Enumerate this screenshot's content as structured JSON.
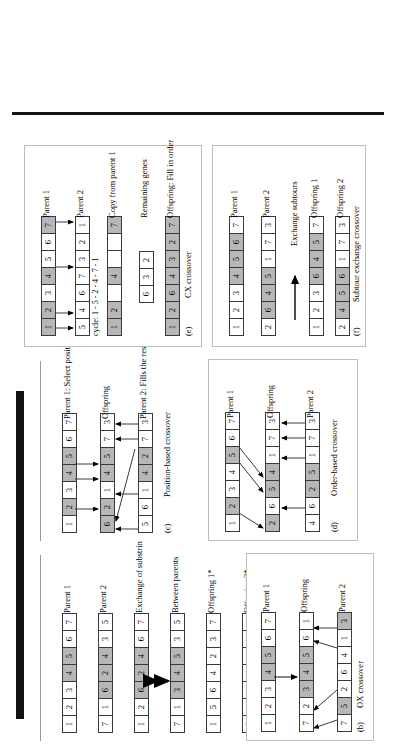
{
  "figure": {
    "shade_color": "#b7b7b7",
    "cell_border": "#3a3a3a"
  },
  "panels": [
    {
      "id": "a",
      "caption": "(a)",
      "name": "PMX crossover",
      "rows": [
        {
          "label": "Parent 1",
          "cells": [
            1,
            2,
            3,
            4,
            5,
            6,
            7
          ],
          "shaded": [
            3,
            4,
            5
          ]
        },
        {
          "label": "Parent 2",
          "cells": [
            7,
            1,
            6,
            2,
            4,
            3,
            5
          ],
          "shaded": [
            2,
            3,
            4
          ]
        },
        {
          "label": "Exchange of substrings",
          "cells": [
            1,
            2,
            6,
            2,
            4,
            6,
            7
          ],
          "shaded": [
            2,
            3,
            4
          ]
        },
        {
          "label": "Between parents",
          "cells": [
            7,
            1,
            3,
            4,
            5,
            3,
            5
          ],
          "shaded": [
            2,
            3,
            4
          ]
        },
        {
          "label": "Offspring 1*",
          "cells": [
            1,
            5,
            6,
            4,
            2,
            3,
            7
          ],
          "shaded": []
        },
        {
          "label": "Offspring 2*",
          "cells": [
            7,
            1,
            3,
            4,
            5,
            6,
            2
          ],
          "shaded": []
        }
      ],
      "footnote": "*Offspring are modified to avoid repeated genes. Not a random process, rather mapping relations are used."
    },
    {
      "id": "b",
      "caption": "(b)",
      "name": "OX crossover",
      "rows": [
        {
          "label": "Parent 1",
          "cells": [
            1,
            2,
            3,
            4,
            5,
            6,
            7
          ],
          "shaded": [
            3,
            4
          ]
        },
        {
          "label": "Offspring",
          "cells": [
            7,
            2,
            3,
            4,
            5,
            6,
            1
          ],
          "shaded": [
            2,
            3,
            4
          ]
        },
        {
          "label": "Parent 2",
          "cells": [
            7,
            5,
            2,
            6,
            4,
            1,
            3
          ],
          "shaded": [
            1,
            6
          ]
        }
      ]
    },
    {
      "id": "c",
      "caption": "(c)",
      "name": "Position-based crossover",
      "rows": [
        {
          "label": "Parent 1: Select positions",
          "cells": [
            1,
            2,
            3,
            4,
            5,
            6,
            7
          ],
          "shaded": [
            1,
            3,
            4
          ]
        },
        {
          "label": "Offspring",
          "cells": [
            6,
            2,
            1,
            4,
            5,
            7,
            3
          ],
          "shaded": [
            0,
            1,
            3,
            4
          ]
        },
        {
          "label": "Parent 2: Fills the rest",
          "cells": [
            5,
            6,
            1,
            4,
            2,
            7,
            3
          ],
          "shaded": [
            3,
            4
          ]
        }
      ]
    },
    {
      "id": "d",
      "caption": "(d)",
      "name": "Order-based crossover",
      "rows": [
        {
          "label": "Parent 1",
          "cells": [
            1,
            2,
            3,
            4,
            5,
            6,
            7
          ],
          "shaded": [
            1,
            4
          ]
        },
        {
          "label": "Offspring",
          "cells": [
            2,
            6,
            5,
            4,
            1,
            7,
            3
          ],
          "shaded": [
            0,
            2,
            3
          ]
        },
        {
          "label": "Parent 2",
          "cells": [
            4,
            6,
            2,
            5,
            1,
            7,
            3
          ],
          "shaded": [
            2,
            3
          ]
        }
      ]
    },
    {
      "id": "e",
      "caption": "(e)",
      "name": "CX crossover",
      "cycle_text": "cycle: 1 - 5 - 2 - 4 - 7 - 1",
      "rows": [
        {
          "label": "Parent 1",
          "cells": [
            1,
            2,
            3,
            4,
            5,
            6,
            7
          ],
          "shaded": [
            0,
            1,
            3,
            6
          ]
        },
        {
          "label": "Parent 2",
          "cells": [
            5,
            4,
            6,
            7,
            3,
            2,
            1
          ],
          "shaded": []
        },
        {
          "label": "Copy from parent 1",
          "cells": [
            1,
            2,
            "",
            "4",
            "",
            "",
            7
          ],
          "shaded": [
            0,
            1,
            3,
            6
          ]
        },
        {
          "label": "Remaining genes",
          "cells": [
            6,
            3,
            2
          ],
          "shaded": []
        },
        {
          "label": "Offspring: Fill in order",
          "cells": [
            1,
            2,
            6,
            4,
            3,
            2,
            7
          ],
          "shaded": [
            0,
            1,
            2,
            3,
            4,
            5,
            6
          ]
        }
      ]
    },
    {
      "id": "f",
      "caption": "(f)",
      "name": "Subtour exchange crossover",
      "middle_label": "Exchange subtours",
      "rows": [
        {
          "label": "Parent 1",
          "cells": [
            1,
            2,
            3,
            4,
            5,
            6,
            7
          ],
          "shaded": [
            3,
            4,
            5
          ]
        },
        {
          "label": "Parent 2",
          "cells": [
            2,
            6,
            4,
            5,
            1,
            7,
            3
          ],
          "shaded": [
            1,
            2,
            3
          ]
        },
        {
          "label": "Offspring 1",
          "cells": [
            1,
            2,
            3,
            6,
            4,
            5,
            7
          ],
          "shaded": [
            3,
            4,
            5
          ]
        },
        {
          "label": "Offspring 2",
          "cells": [
            2,
            4,
            5,
            6,
            1,
            7,
            3
          ],
          "shaded": [
            1,
            2,
            3
          ]
        }
      ]
    }
  ]
}
